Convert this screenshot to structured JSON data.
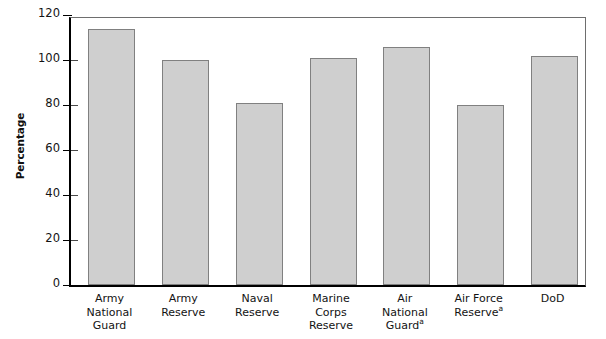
{
  "chart_data": {
    "type": "bar",
    "title": "",
    "xlabel": "",
    "ylabel": "Percentage",
    "ylim": [
      0,
      120
    ],
    "yticks": [
      0,
      20,
      40,
      60,
      80,
      100,
      120
    ],
    "grid": false,
    "legend": false,
    "categories": [
      "Army National Guard",
      "Army Reserve",
      "Naval Reserve",
      "Marine Corps Reserve",
      "Air National Guard",
      "Air Force Reserve",
      "DoD"
    ],
    "category_lines": [
      [
        "Army",
        "National",
        "Guard"
      ],
      [
        "Army",
        "Reserve"
      ],
      [
        "Naval",
        "Reserve"
      ],
      [
        "Marine",
        "Corps",
        "Reserve"
      ],
      [
        "Air",
        "National",
        "Guard"
      ],
      [
        "Air Force",
        "Reserve"
      ],
      [
        "DoD"
      ]
    ],
    "footnote_markers": [
      "",
      "",
      "",
      "",
      "a",
      "a",
      ""
    ],
    "values": [
      114,
      100,
      81,
      101,
      106,
      80,
      102
    ],
    "bar_color": "#cfcfcf",
    "bar_border_color": "#808080",
    "axis_color": "#000000",
    "frame_color": "#6e6e6e"
  }
}
